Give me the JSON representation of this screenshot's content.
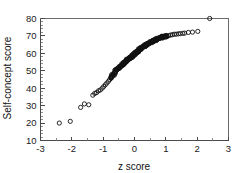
{
  "chart_data": {
    "type": "scatter",
    "title": "",
    "xlabel": "z score",
    "ylabel": "Self-concept score",
    "xlim": [
      -3,
      3
    ],
    "ylim": [
      10,
      80
    ],
    "grid": false,
    "legend": null,
    "x_ticks": [
      -3,
      -2,
      -1,
      0,
      1,
      2,
      3
    ],
    "x_tick_labels": [
      "-3",
      "-2",
      "-1",
      "0",
      "1",
      "2",
      "3"
    ],
    "x_minor_tick_step": 0.5,
    "y_ticks": [
      10,
      20,
      30,
      40,
      50,
      60,
      70,
      80
    ],
    "y_tick_labels": [
      "10",
      "20",
      "30",
      "40",
      "50",
      "60",
      "70",
      "80"
    ],
    "y_minor_tick_step": 2,
    "marker": "open-circle",
    "marker_color": "#111111",
    "points": [
      [
        -2.4,
        20.0
      ],
      [
        -2.05,
        21.0
      ],
      [
        -1.72,
        29.0
      ],
      [
        -1.6,
        31.0
      ],
      [
        -1.46,
        30.5
      ],
      [
        -1.33,
        36.0
      ],
      [
        -1.27,
        37.0
      ],
      [
        -1.21,
        37.5
      ],
      [
        -1.15,
        38.5
      ],
      [
        -1.09,
        39.0
      ],
      [
        -1.03,
        40.0
      ],
      [
        -0.98,
        41.0
      ],
      [
        -0.93,
        42.0
      ],
      [
        -0.88,
        43.0
      ],
      [
        -0.83,
        44.0
      ],
      [
        -0.79,
        45.0
      ],
      [
        -0.75,
        46.0
      ],
      [
        -0.71,
        47.0
      ],
      [
        -0.67,
        48.0
      ],
      [
        -0.63,
        49.0
      ],
      [
        -0.6,
        50.0
      ],
      [
        -0.57,
        50.5
      ],
      [
        -0.54,
        51.0
      ],
      [
        -0.51,
        51.5
      ],
      [
        -0.48,
        52.0
      ],
      [
        -0.45,
        52.5
      ],
      [
        -0.42,
        53.0
      ],
      [
        -0.39,
        53.5
      ],
      [
        -0.36,
        54.0
      ],
      [
        -0.34,
        54.5
      ],
      [
        -0.31,
        55.0
      ],
      [
        -0.29,
        55.3
      ],
      [
        -0.26,
        55.7
      ],
      [
        -0.24,
        56.0
      ],
      [
        -0.21,
        56.3
      ],
      [
        -0.19,
        56.7
      ],
      [
        -0.17,
        57.0
      ],
      [
        -0.15,
        57.3
      ],
      [
        -0.12,
        57.6
      ],
      [
        -0.1,
        58.0
      ],
      [
        -0.08,
        58.3
      ],
      [
        -0.06,
        58.6
      ],
      [
        -0.04,
        59.0
      ],
      [
        -0.02,
        59.3
      ],
      [
        0.0,
        59.6
      ],
      [
        0.02,
        60.0
      ],
      [
        0.04,
        60.3
      ],
      [
        0.06,
        60.6
      ],
      [
        0.08,
        61.0
      ],
      [
        0.1,
        61.3
      ],
      [
        0.12,
        61.6
      ],
      [
        0.15,
        62.0
      ],
      [
        0.17,
        62.3
      ],
      [
        0.19,
        62.6
      ],
      [
        0.21,
        63.0
      ],
      [
        0.24,
        63.3
      ],
      [
        0.26,
        63.6
      ],
      [
        0.29,
        64.0
      ],
      [
        0.31,
        64.3
      ],
      [
        0.34,
        64.6
      ],
      [
        0.36,
        65.0
      ],
      [
        0.39,
        65.2
      ],
      [
        0.42,
        65.5
      ],
      [
        0.45,
        65.8
      ],
      [
        0.48,
        66.0
      ],
      [
        0.51,
        66.3
      ],
      [
        0.54,
        66.6
      ],
      [
        0.57,
        67.0
      ],
      [
        0.6,
        67.2
      ],
      [
        0.63,
        67.5
      ],
      [
        0.67,
        67.8
      ],
      [
        0.71,
        68.0
      ],
      [
        0.75,
        68.3
      ],
      [
        0.79,
        68.6
      ],
      [
        0.83,
        69.0
      ],
      [
        0.88,
        69.2
      ],
      [
        0.93,
        69.5
      ],
      [
        0.98,
        69.8
      ],
      [
        1.03,
        70.0
      ],
      [
        1.09,
        70.2
      ],
      [
        1.15,
        70.5
      ],
      [
        1.21,
        70.7
      ],
      [
        1.27,
        71.0
      ],
      [
        1.33,
        71.0
      ],
      [
        1.4,
        71.2
      ],
      [
        1.46,
        71.3
      ],
      [
        1.54,
        71.5
      ],
      [
        1.6,
        71.6
      ],
      [
        1.72,
        72.0
      ],
      [
        1.85,
        72.2
      ],
      [
        2.02,
        72.6
      ],
      [
        2.4,
        80.0
      ]
    ],
    "dense_band": {
      "x_range": [
        -0.75,
        1.05
      ],
      "description": "heavy overlapping open circles forming a thick band"
    }
  },
  "figure": {
    "background_color": "#ffffff",
    "frame_color": "#6b6b6b",
    "text_color": "#111111"
  }
}
